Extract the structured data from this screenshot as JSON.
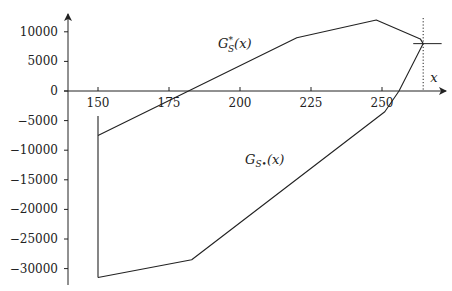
{
  "chart_data": {
    "type": "line",
    "title": "",
    "xlabel": "x",
    "ylabel": "",
    "xlim": [
      138,
      270
    ],
    "ylim": [
      -32500,
      13500
    ],
    "grid": false,
    "x_ticks": [
      150,
      175,
      200,
      225,
      250
    ],
    "x_tick_labels": [
      "150",
      "175",
      "200",
      "225",
      "250"
    ],
    "y_ticks": [
      10000,
      5000,
      0,
      -5000,
      -10000,
      -15000,
      -20000,
      -25000,
      -30000
    ],
    "y_tick_labels": [
      "10000",
      "5000",
      "0",
      "−5000",
      "−10000",
      "−15000",
      "−20000",
      "−25000",
      "−30000"
    ],
    "series": [
      {
        "name": "G*_S(x)",
        "label_main": "G",
        "label_sup": "*",
        "label_sub": "S",
        "label_arg": "(x)",
        "x": [
          150,
          220,
          248,
          263.5,
          264.5
        ],
        "y": [
          -7500,
          9000,
          12000,
          8800,
          8000
        ]
      },
      {
        "name": "G_S*(x)",
        "label_main": "G",
        "label_sub": "S•",
        "label_arg": "(x)",
        "x": [
          150,
          183,
          251,
          256,
          264.5
        ],
        "y": [
          -31500,
          -28500,
          -3500,
          0,
          8000
        ]
      },
      {
        "name": "vertical segment at x=150",
        "x": [
          150,
          150
        ],
        "y": [
          -4200,
          -31500
        ]
      }
    ],
    "annotations": [
      {
        "type": "vline-dotted",
        "x": 264.5,
        "label": "x"
      },
      {
        "type": "hline-segment",
        "y": 8000,
        "x_range": [
          261,
          271
        ]
      }
    ]
  }
}
